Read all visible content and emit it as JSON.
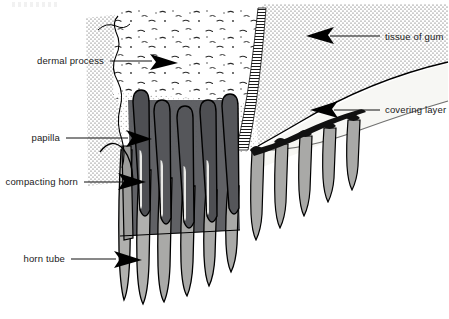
{
  "figure": {
    "width": 449,
    "height": 319,
    "background_color": "#ffffff"
  },
  "labels": {
    "left": [
      {
        "id": "dermal-process",
        "text": "dermal process",
        "text_x": 104,
        "text_y": 64,
        "leader_from_x": 110,
        "leader_from_y": 61,
        "leader_to_x": 150,
        "leader_to_y": 61,
        "arrow_tip_x": 178,
        "arrow_tip_y": 63,
        "arrow_dir": "right"
      },
      {
        "id": "papilla",
        "text": "papilla",
        "text_x": 60,
        "text_y": 141,
        "leader_from_x": 66,
        "leader_from_y": 138,
        "leader_to_x": 112,
        "leader_to_y": 138,
        "arrow_tip_x": 152,
        "arrow_tip_y": 139,
        "arrow_dir": "right"
      },
      {
        "id": "compacting-horn",
        "text": "compacting horn",
        "text_x": 78,
        "text_y": 185,
        "leader_from_x": 84,
        "leader_from_y": 182,
        "leader_to_x": 112,
        "leader_to_y": 182,
        "arrow_tip_x": 146,
        "arrow_tip_y": 182,
        "arrow_dir": "right"
      },
      {
        "id": "horn-tube",
        "text": "horn tube",
        "text_x": 65,
        "text_y": 262,
        "leader_from_x": 71,
        "leader_from_y": 259,
        "leader_to_x": 104,
        "leader_to_y": 259,
        "arrow_tip_x": 142,
        "arrow_tip_y": 260,
        "arrow_dir": "right"
      }
    ],
    "right": [
      {
        "id": "tissue-of-gum",
        "text": "tissue of gum",
        "text_x": 385,
        "text_y": 40,
        "leader_from_x": 380,
        "leader_from_y": 36,
        "leader_to_x": 340,
        "leader_to_y": 36,
        "arrow_tip_x": 306,
        "arrow_tip_y": 36,
        "arrow_dir": "left"
      },
      {
        "id": "covering-layer",
        "text": "covering layer",
        "text_x": 385,
        "text_y": 113,
        "leader_from_x": 380,
        "leader_from_y": 110,
        "leader_to_x": 342,
        "leader_to_y": 110,
        "arrow_tip_x": 310,
        "arrow_tip_y": 110,
        "arrow_dir": "left"
      }
    ]
  },
  "regions": {
    "dermal_process_tissue": {
      "name": "dermal process tissue",
      "fill": "#ffffff",
      "texture": "speckled flecks"
    },
    "left_gum_band": {
      "name": "left dotted gum band",
      "fill": "#ffffff",
      "texture": "fine stipple dots"
    },
    "tissue_of_gum": {
      "name": "tissue of gum",
      "fill": "#ffffff",
      "texture": "fine stipple dots"
    },
    "covering_layer": {
      "name": "covering layer",
      "fill": "#f7f7f4",
      "texture": "plain"
    },
    "hatched_wedge": {
      "name": "hatched separating wedge",
      "fill": "#ffffff",
      "texture": "horizontal hatching"
    },
    "papillae": {
      "name": "papillae cores",
      "fill": "#55565a",
      "count": 5
    },
    "horn_tubes_left": {
      "name": "horn tubes (left group)",
      "fill": "#a9a9a7",
      "count": 6
    },
    "horn_tubes_right": {
      "name": "horn tubes (right group)",
      "fill": "#a9a9a7",
      "count": 5
    },
    "compacting_horn": {
      "name": "compacting horn mass",
      "fill": "#6d6e71"
    }
  },
  "colors": {
    "ink": "#000000",
    "text": "#1a1a1a",
    "papilla_dark": "#55565a",
    "papilla_darker": "#4a4b4f",
    "tube_gray": "#a9a9a7",
    "tube_gray_light": "#bcbcba",
    "covering_layer": "#f7f7f4",
    "background": "#ffffff"
  }
}
